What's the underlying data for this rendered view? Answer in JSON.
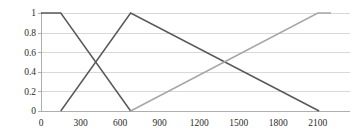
{
  "chart_data": {
    "type": "line",
    "title": "",
    "subtitle": "",
    "xlabel": "",
    "ylabel": "",
    "xlim": [
      0,
      2200
    ],
    "ylim": [
      0,
      1
    ],
    "grid": true,
    "legend": "none",
    "xticks": [
      0,
      300,
      600,
      900,
      1200,
      1500,
      1800,
      2100
    ],
    "xtick_labels": [
      "0",
      "300",
      "600",
      "900",
      "1200",
      "1500",
      "1800",
      "2100"
    ],
    "yticks": [
      0,
      0.2,
      0.4,
      0.6,
      0.8,
      1
    ],
    "ytick_labels": [
      "0",
      "0.2",
      "0.4",
      "0.6",
      "0.8",
      "1"
    ],
    "series": [
      {
        "name": "low",
        "color": "#595959",
        "width": 1.5,
        "x": [
          0,
          150,
          680
        ],
        "y": [
          1,
          1,
          0
        ]
      },
      {
        "name": "medium",
        "color": "#595959",
        "width": 1.5,
        "x": [
          150,
          680,
          2110
        ],
        "y": [
          0,
          1,
          0
        ]
      },
      {
        "name": "high",
        "color": "#a6a6a6",
        "width": 1.5,
        "x": [
          680,
          2100,
          2200
        ],
        "y": [
          0,
          1,
          1
        ]
      }
    ]
  },
  "plot": {
    "axis_color": "#9a9a9a",
    "grid_color": "#c8c8c8",
    "background": "#ffffff"
  }
}
